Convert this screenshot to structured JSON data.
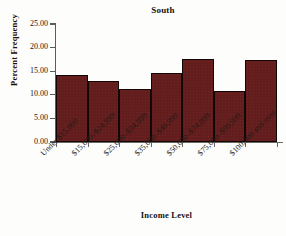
{
  "chart_data": {
    "type": "bar",
    "title": "South",
    "xlabel": "Income Level",
    "ylabel": "Percent Frequency",
    "categories": [
      "Under $15,000",
      "$15,000–$24,999",
      "$25,000–$34,999",
      "$35,000–$49,999",
      "$50,000–$74,999",
      "$75,000–$99,999",
      "$100,000 and over"
    ],
    "values": [
      14.3,
      13.0,
      11.3,
      14.7,
      17.5,
      10.8,
      17.3
    ],
    "ylim": [
      0,
      25
    ],
    "ytick_labels": [
      "0.00",
      "5.00",
      "10.00",
      "15.00",
      "20.00",
      "25.00"
    ],
    "ytick_values": [
      0,
      5,
      10,
      15,
      20,
      25
    ],
    "grid": false,
    "legend": false,
    "bar_color": "#621d1c",
    "bar_edge_color": "#120705",
    "axis_color": "#5f5b59",
    "text_color": "#16100f"
  }
}
